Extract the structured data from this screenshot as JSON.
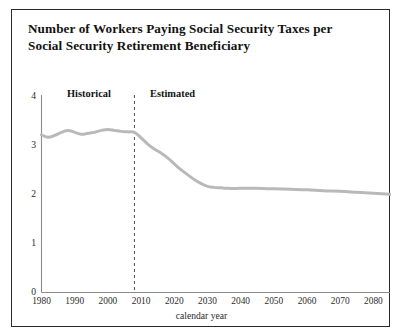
{
  "figure": {
    "title": "Number of Workers Paying Social Security Taxes per Social Security Retirement Beneficiary",
    "line_color": "#b9b9b9",
    "axis_color": "#8c8c8c",
    "border_color": "#2b2b2b"
  },
  "annotations": {
    "historical": "Historical",
    "estimated": "Estimated",
    "divider_year": 2008
  },
  "chart_data": {
    "type": "line",
    "title": "Number of Workers Paying Social Security Taxes per Social Security Retirement Beneficiary",
    "xlabel": "calendar year",
    "ylabel": "",
    "xlim": [
      1980,
      2085
    ],
    "ylim": [
      0,
      4
    ],
    "grid": false,
    "legend": "none",
    "xticks": [
      1980,
      1990,
      2000,
      2010,
      2020,
      2030,
      2040,
      2050,
      2060,
      2070,
      2080
    ],
    "xtick_labels": [
      "1980",
      "1990",
      "2000",
      "2010",
      "2020",
      "2030",
      "2040",
      "2050",
      "2060",
      "2070",
      "2080"
    ],
    "yticks": [
      0,
      1,
      2,
      3,
      4
    ],
    "ytick_labels": [
      "0",
      "1",
      "2",
      "3",
      "4"
    ],
    "series": [
      {
        "name": "Workers per beneficiary",
        "color": "#b9b9b9",
        "x": [
          1980,
          1982,
          1984,
          1986,
          1988,
          1990,
          1992,
          1994,
          1996,
          1998,
          2000,
          2002,
          2004,
          2006,
          2008,
          2010,
          2012,
          2014,
          2016,
          2018,
          2020,
          2022,
          2024,
          2026,
          2028,
          2030,
          2032,
          2034,
          2036,
          2040,
          2045,
          2050,
          2055,
          2060,
          2065,
          2070,
          2075,
          2080,
          2085
        ],
        "y": [
          3.21,
          3.16,
          3.2,
          3.26,
          3.3,
          3.26,
          3.22,
          3.24,
          3.26,
          3.3,
          3.32,
          3.3,
          3.28,
          3.27,
          3.26,
          3.15,
          3.02,
          2.92,
          2.84,
          2.74,
          2.62,
          2.5,
          2.4,
          2.3,
          2.22,
          2.16,
          2.14,
          2.13,
          2.12,
          2.12,
          2.12,
          2.11,
          2.1,
          2.09,
          2.07,
          2.06,
          2.04,
          2.02,
          2.0
        ]
      }
    ],
    "annotations": [
      {
        "text": "Historical",
        "x": 1993,
        "y": 3.82
      },
      {
        "text": "Estimated",
        "x": 2032,
        "y": 3.82
      },
      {
        "text": "divider",
        "x": 2008,
        "type": "vline-dashed"
      }
    ]
  }
}
